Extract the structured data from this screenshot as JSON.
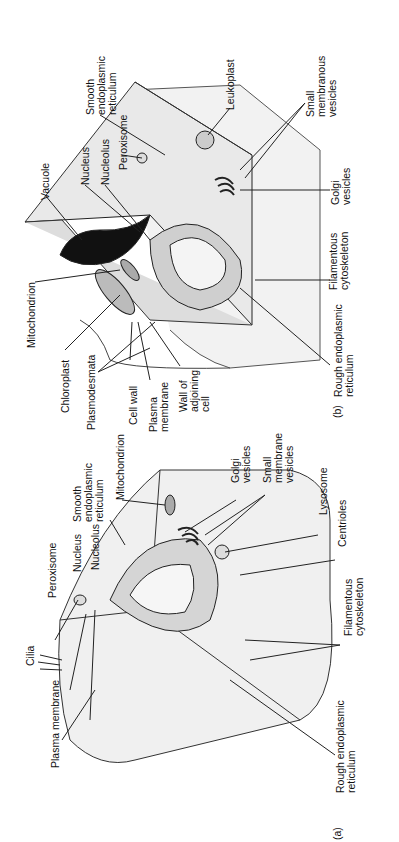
{
  "figure": {
    "panels": [
      {
        "id": "b",
        "caption": "(b)",
        "subject": "plant-cell",
        "labels": [
          {
            "text": "Mitochondrion",
            "x": 26,
            "y": 348
          },
          {
            "text": "Vacuole",
            "x": 40,
            "y": 200
          },
          {
            "text": "Nucleus",
            "x": 80,
            "y": 185
          },
          {
            "text": "Nucleolus",
            "x": 100,
            "y": 185
          },
          {
            "text": "Peroxisome",
            "x": 118,
            "y": 170
          },
          {
            "text": "Smooth\nendoplasmic\nreticulum",
            "x": 85,
            "y": 115
          },
          {
            "text": "Leukoplast",
            "x": 225,
            "y": 110
          },
          {
            "text": "Small\nmembranous\nvesicles",
            "x": 305,
            "y": 117
          },
          {
            "text": "Golgi\nvesicles",
            "x": 330,
            "y": 205
          },
          {
            "text": "Filamentous\ncytoskeleton",
            "x": 328,
            "y": 290
          },
          {
            "text": "Rough endoplasmic\nreticulum",
            "x": 333,
            "y": 397
          },
          {
            "text": "Chloroplast",
            "x": 60,
            "y": 413
          },
          {
            "text": "Plasmodesmata",
            "x": 86,
            "y": 430
          },
          {
            "text": "Cell wall",
            "x": 128,
            "y": 425
          },
          {
            "text": "Plasma\nmembrane",
            "x": 148,
            "y": 432
          },
          {
            "text": "Wall of\nadjoining\ncell",
            "x": 178,
            "y": 412
          }
        ],
        "caption_pos": {
          "x": 332,
          "y": 418
        }
      },
      {
        "id": "a",
        "caption": "(a)",
        "subject": "animal-cell",
        "labels": [
          {
            "text": "Cilia",
            "x": 25,
            "y": 666
          },
          {
            "text": "Plasma membrane",
            "x": 50,
            "y": 768
          },
          {
            "text": "Peroxisome",
            "x": 47,
            "y": 598
          },
          {
            "text": "Nucleus",
            "x": 72,
            "y": 572
          },
          {
            "text": "Nucleolus",
            "x": 90,
            "y": 570
          },
          {
            "text": "Smooth\nendoplasmic\nreticulum",
            "x": 72,
            "y": 522
          },
          {
            "text": "Mitochondrion",
            "x": 115,
            "y": 500
          },
          {
            "text": "Golgi\nvesicles",
            "x": 230,
            "y": 483
          },
          {
            "text": "Small\nmembrane\nvesicles",
            "x": 262,
            "y": 483
          },
          {
            "text": "Lysosome",
            "x": 318,
            "y": 515
          },
          {
            "text": "Centrioles",
            "x": 337,
            "y": 547
          },
          {
            "text": "Filamentous\ncytoskeleton",
            "x": 343,
            "y": 636
          },
          {
            "text": "Rough endoplasmic\nreticulum",
            "x": 335,
            "y": 793
          }
        ],
        "caption_pos": {
          "x": 332,
          "y": 840
        }
      }
    ]
  }
}
